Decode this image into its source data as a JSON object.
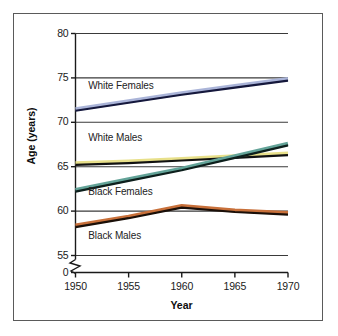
{
  "chart_data": {
    "type": "line",
    "title": "",
    "xlabel": "Year",
    "ylabel": "Age (years)",
    "x": [
      1950,
      1955,
      1960,
      1965,
      1970
    ],
    "xlim": [
      1950,
      1970
    ],
    "ylim": [
      55,
      80
    ],
    "y_axis_break_label": "0",
    "grid": true,
    "grid_orientation": "horizontal",
    "legend_position": "inline-labels",
    "yticks": [
      55,
      60,
      65,
      70,
      75,
      80
    ],
    "ytick_labels": [
      "55",
      "60",
      "65",
      "70",
      "75",
      "80"
    ],
    "xticks": [
      1950,
      1955,
      1960,
      1965,
      1970
    ],
    "xtick_labels": [
      "1950",
      "1955",
      "1960",
      "1965",
      "1970"
    ],
    "series": [
      {
        "name": "White Females",
        "color": "#aab4d8",
        "line_color": "#15183c",
        "values": [
          71.3,
          72.2,
          73.1,
          73.9,
          74.7
        ],
        "label_x": 1951.2,
        "label_y": 74.0
      },
      {
        "name": "White Males",
        "color": "#e8e08a",
        "line_color": "#111111",
        "values": [
          65.2,
          65.4,
          65.7,
          66.0,
          66.3
        ],
        "label_x": 1951.2,
        "label_y": 68.1
      },
      {
        "name": "Black Females",
        "color": "#63a398",
        "line_color": "#0d1f1c",
        "values": [
          62.2,
          63.4,
          64.6,
          66.0,
          67.4
        ],
        "label_x": 1951.2,
        "label_y": 62.0
      },
      {
        "name": "Black Males",
        "color": "#c8703a",
        "line_color": "#1a0f08",
        "values": [
          58.2,
          59.2,
          60.4,
          59.9,
          59.6
        ],
        "label_x": 1951.2,
        "label_y": 57.1
      }
    ]
  },
  "figure": {
    "frame_color": "#5a5a5a",
    "background": "#ffffff",
    "axis_color": "#1a1a1a",
    "gridline_color": "#3a3a3a"
  }
}
